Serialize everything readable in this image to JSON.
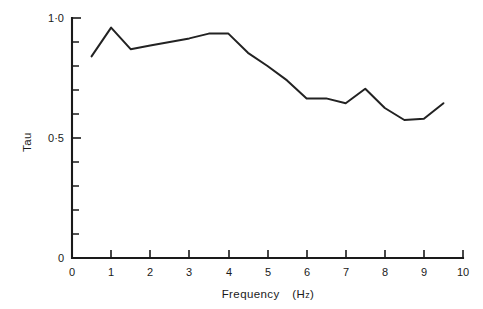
{
  "chart_data": {
    "type": "line",
    "title": "",
    "xlabel": "Frequency  (Hz)",
    "ylabel": "Tau",
    "xlim": [
      0,
      10
    ],
    "ylim": [
      0,
      1.0
    ],
    "grid": false,
    "legend": "none",
    "x_ticks": [
      0,
      1,
      2,
      3,
      4,
      5,
      6,
      7,
      8,
      9,
      10
    ],
    "x_tick_labels": [
      "0",
      "1",
      "2",
      "3",
      "4",
      "5",
      "6",
      "7",
      "8",
      "9",
      "10"
    ],
    "y_ticks": [
      0,
      0.5,
      1.0
    ],
    "y_tick_labels": [
      "0",
      "0·5",
      "1·0"
    ],
    "y_minor_ticks": [
      0.1,
      0.2,
      0.3,
      0.4,
      0.6,
      0.7,
      0.8,
      0.9
    ],
    "series": [
      {
        "name": "Tau",
        "color": "#222222",
        "x": [
          0.5,
          1.0,
          1.5,
          2.0,
          2.5,
          3.0,
          3.5,
          4.0,
          4.5,
          5.0,
          5.5,
          6.0,
          6.5,
          7.0,
          7.5,
          8.0,
          8.5,
          9.0,
          9.5
        ],
        "y": [
          0.84,
          0.96,
          0.87,
          0.885,
          0.9,
          0.915,
          0.935,
          0.935,
          0.855,
          0.8,
          0.74,
          0.665,
          0.665,
          0.645,
          0.705,
          0.625,
          0.575,
          0.58,
          0.645
        ]
      }
    ]
  },
  "axis_titles": {
    "x": "Frequency  (Hz)",
    "x_main": "Frequency",
    "x_unit_open": "(H",
    "x_unit_sub": "z",
    "x_unit_close": ")",
    "y": "Tau"
  },
  "colors": {
    "curve": "#222222",
    "axis": "#1a1a1a",
    "background": "#ffffff"
  }
}
